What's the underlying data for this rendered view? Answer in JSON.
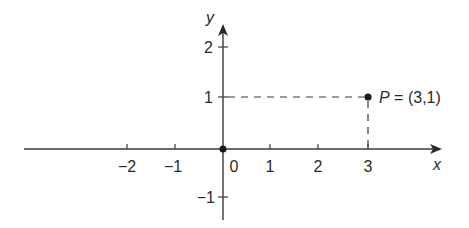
{
  "diagram": {
    "type": "coordinate-plane",
    "x_axis_label": "x",
    "y_axis_label": "y",
    "x_ticks": [
      {
        "label": "−2",
        "value": -2
      },
      {
        "label": "−1",
        "value": -1
      },
      {
        "label": "0",
        "value": 0
      },
      {
        "label": "1",
        "value": 1
      },
      {
        "label": "2",
        "value": 2
      },
      {
        "label": "3",
        "value": 3
      }
    ],
    "y_ticks": [
      {
        "label": "2",
        "value": 2
      },
      {
        "label": "1",
        "value": 1
      },
      {
        "label": "−1",
        "value": -1
      }
    ],
    "points": [
      {
        "name": "origin",
        "x": 0,
        "y": 0
      },
      {
        "name": "P",
        "x": 3,
        "y": 1,
        "label_name": "P",
        "label_coords": " = (3,1)"
      }
    ],
    "colors": {
      "ink": "#2a2a2a",
      "background": "#ffffff"
    }
  }
}
